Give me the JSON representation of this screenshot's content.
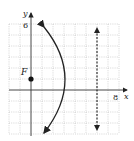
{
  "diagram": {
    "type": "parabola-graph",
    "axes": {
      "x_label": "x",
      "y_label": "y",
      "x_tick_label": "8",
      "y_tick_label": "6"
    },
    "focus": {
      "label": "F",
      "x": 0,
      "y": 2
    },
    "vertex": {
      "x": 3,
      "y": 2
    },
    "directrix": {
      "x": 6,
      "style": "dashed"
    },
    "grid": {
      "x_min": -2,
      "x_max": 8,
      "y_min": -4,
      "y_max": 6,
      "step": 1
    },
    "colors": {
      "curve": "#222222",
      "grid": "#b0b0b0",
      "axis": "#333333"
    }
  }
}
